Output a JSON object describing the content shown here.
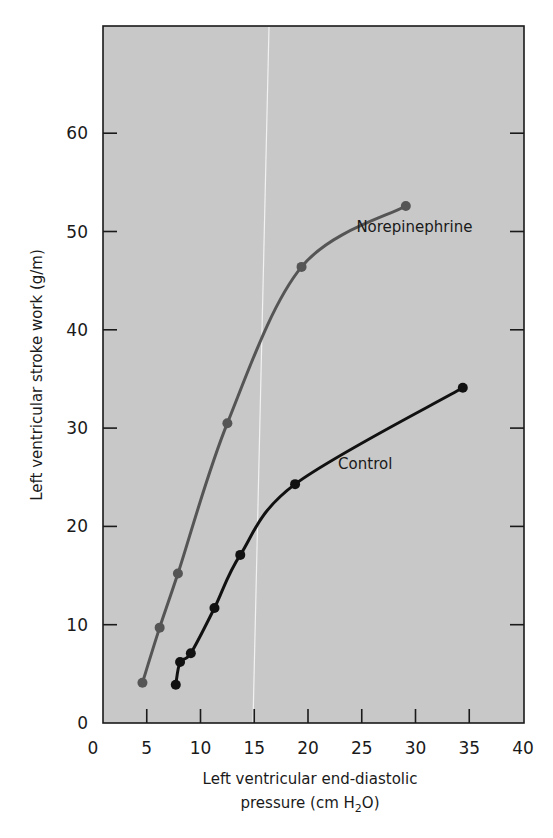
{
  "chart_data": {
    "type": "line",
    "title": "",
    "xlabel": "Left ventricular end-diastolic pressure (cm H2O)",
    "xlabel_lines": [
      "Left ventricular end-diastolic",
      "pressure (cm H",
      "2",
      "O)"
    ],
    "ylabel": "Left ventricular stroke work (g/m)",
    "xlim": [
      0,
      40
    ],
    "ylim": [
      0,
      70
    ],
    "xticks": [
      0,
      5,
      10,
      15,
      20,
      25,
      30,
      35,
      40
    ],
    "yticks": [
      0,
      10,
      20,
      30,
      40,
      50,
      60
    ],
    "grid": false,
    "legend": "inline labels",
    "background": "#c8c8c8",
    "series": [
      {
        "name": "Norepinephrine",
        "color": "#555555",
        "x": [
          4.6,
          6.2,
          7.9,
          12.5,
          19.4,
          29.1
        ],
        "y": [
          4.1,
          9.7,
          15.2,
          30.5,
          46.4,
          52.6
        ],
        "label_pos": [
          24.5,
          50.0
        ]
      },
      {
        "name": "Control",
        "color": "#111111",
        "x": [
          7.7,
          8.1,
          9.1,
          11.3,
          13.7,
          18.8,
          34.4
        ],
        "y": [
          3.9,
          6.2,
          7.1,
          11.7,
          17.1,
          24.3,
          34.1
        ],
        "label_pos": [
          22.8,
          25.8
        ]
      }
    ]
  }
}
